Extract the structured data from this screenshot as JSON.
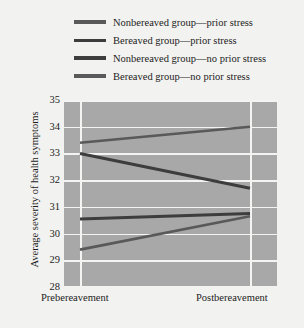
{
  "legend": {
    "items": [
      {
        "label": "Nonbereaved group—prior stress",
        "swatch": "line-swatch",
        "color": "#595959"
      },
      {
        "label": "Bereaved group—prior stress",
        "swatch": "line-swatch",
        "color": "#3d3d3d"
      },
      {
        "label": "Nonbereaved group—no prior stress",
        "swatch": "line-swatch",
        "color": "#3d3d3d"
      },
      {
        "label": "Bereaved group—no prior stress",
        "swatch": "line-swatch",
        "color": "#595959"
      }
    ]
  },
  "axes": {
    "ylabel": "Average severity of health symptoms",
    "yticks": [
      "35",
      "34",
      "33",
      "32",
      "31",
      "30",
      "29",
      "28"
    ],
    "xticks": [
      "Prebereavement",
      "Postbereavement"
    ]
  },
  "colors": {
    "figure_background": "#f2f2f0",
    "plot_background": "#a8a8a8",
    "gridline": "#f4f4f2",
    "line_dark": "#3d3d3d",
    "line_medium": "#595959",
    "text": "#1c1c1c"
  },
  "chart_data": {
    "type": "line",
    "title": "",
    "xlabel": "",
    "ylabel": "Average severity of health symptoms",
    "categories": [
      "Prebereavement",
      "Postbereavement"
    ],
    "ylim": [
      28,
      35
    ],
    "yticks": [
      28,
      29,
      30,
      31,
      32,
      33,
      34,
      35
    ],
    "grid": true,
    "legend_position": "top",
    "series": [
      {
        "name": "Nonbereaved group—prior stress",
        "values": [
          33.4,
          34.0
        ],
        "color": "#595959",
        "width": 2.6
      },
      {
        "name": "Bereaved group—prior stress",
        "values": [
          33.0,
          31.7
        ],
        "color": "#3d3d3d",
        "width": 3.0
      },
      {
        "name": "Nonbereaved group—no prior stress",
        "values": [
          30.55,
          30.75
        ],
        "color": "#3d3d3d",
        "width": 3.0
      },
      {
        "name": "Bereaved group—no prior stress",
        "values": [
          29.4,
          30.65
        ],
        "color": "#595959",
        "width": 2.6
      }
    ]
  }
}
